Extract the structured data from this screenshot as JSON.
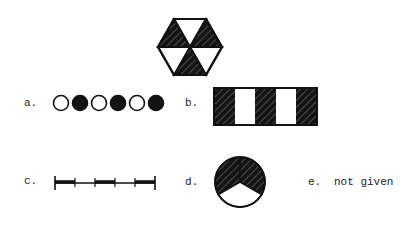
{
  "colors": {
    "ink": "#111111",
    "background": "#ffffff"
  },
  "figure": {
    "name": "hexagon-target",
    "shape": "hexagon divided into 6 triangles",
    "shaded_triangles": [
      "top-left",
      "top-right",
      "bottom"
    ],
    "unshaded_triangles": [
      "top",
      "right-bottom",
      "left-bottom"
    ]
  },
  "options": [
    {
      "id": "a",
      "label": "a.",
      "description": "six circles alternating unshaded and shaded",
      "circles": [
        "open",
        "filled",
        "open",
        "filled",
        "open",
        "filled"
      ]
    },
    {
      "id": "b",
      "label": "b.",
      "description": "rectangle with five vertical stripes alternating shaded and unshaded",
      "stripes": [
        "shaded",
        "open",
        "shaded",
        "open",
        "shaded"
      ]
    },
    {
      "id": "c",
      "label": "c.",
      "description": "line segment divided into five parts alternating thick and thin",
      "segments": [
        "thick",
        "thin",
        "thick",
        "thin",
        "thick"
      ]
    },
    {
      "id": "d",
      "label": "d.",
      "description": "circle divided into three sectors, two shaded and one unshaded",
      "sectors": [
        "shaded",
        "shaded",
        "open"
      ]
    },
    {
      "id": "e",
      "label": "e.",
      "text": "not given"
    }
  ]
}
